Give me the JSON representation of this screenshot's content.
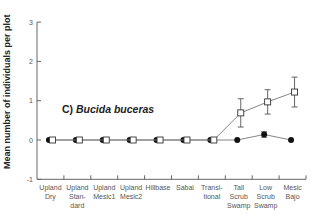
{
  "chart_data": {
    "type": "line",
    "title": "",
    "panel_label": "C)",
    "panel_species": "Bucida buceras",
    "xlabel": "",
    "ylabel": "Mean number of individuals per plot",
    "ylim": [
      -1,
      3
    ],
    "yticks": [
      -1,
      0,
      1,
      2,
      3
    ],
    "grid": false,
    "legend": "none",
    "categories": [
      "Upland Dry",
      "Upland Standard",
      "Upland Mesic1",
      "Upland Mesic2",
      "Hillbase",
      "Sabal",
      "Transitional",
      "Tall Scrub Swamp",
      "Low Scrub Swamp",
      "Mesic Bajo"
    ],
    "category_labels": [
      [
        "Upland",
        "Dry"
      ],
      [
        "Upland",
        "Stan-",
        "dard"
      ],
      [
        "Upland",
        "Mesic1"
      ],
      [
        "Upland",
        "Mesic2"
      ],
      [
        "Hillbase"
      ],
      [
        "Sabal"
      ],
      [
        "Transi-",
        "tional"
      ],
      [
        "Tall",
        "Scrub",
        "Swamp"
      ],
      [
        "Low",
        "Scrub",
        "Swamp"
      ],
      [
        "Mesic",
        "Bajo"
      ]
    ],
    "series": [
      {
        "name": "filled circles",
        "marker": "filled-circle",
        "values": [
          0,
          0,
          0,
          0,
          0,
          0,
          0,
          0,
          0.14,
          0
        ],
        "errors": [
          0,
          0,
          0,
          0,
          0,
          0,
          0,
          0,
          0.07,
          0
        ]
      },
      {
        "name": "open squares",
        "marker": "open-square",
        "values": [
          0,
          0,
          0,
          0,
          0,
          0,
          0,
          0.69,
          0.97,
          1.22
        ],
        "errors": [
          0,
          0,
          0,
          0,
          0,
          0,
          0,
          0.36,
          0.31,
          0.38
        ]
      }
    ]
  },
  "labels": {
    "ylabel": "Mean number of individuals per plot",
    "panel_prefix": "C) ",
    "panel_species": "Bucida buceras"
  }
}
